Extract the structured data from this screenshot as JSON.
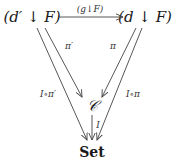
{
  "diagram": {
    "type": "commutative-diagram",
    "nodes": {
      "top_left": "(d′ ↓ F)",
      "top_right": "(d ↓ F)",
      "center": "𝒞",
      "bottom": "Set"
    },
    "edges": [
      {
        "from": "top_left",
        "to": "top_right",
        "label": "(g↓F)"
      },
      {
        "from": "top_left",
        "to": "center",
        "label": "π′"
      },
      {
        "from": "top_right",
        "to": "center",
        "label": "π"
      },
      {
        "from": "top_left",
        "to": "bottom",
        "label": "I∘π′"
      },
      {
        "from": "top_right",
        "to": "bottom",
        "label": "I∘π"
      },
      {
        "from": "center",
        "to": "bottom",
        "label": "I"
      }
    ],
    "labels": {
      "top_arrow": "(g↓F)",
      "pi_prime": "π′",
      "pi": "π",
      "i_pi_prime": "I∘π′",
      "i_pi": "I∘π",
      "i": "I"
    },
    "colors": {
      "ink": "#1a1a1a",
      "edge": "#444444",
      "background": "#ffffff"
    }
  }
}
